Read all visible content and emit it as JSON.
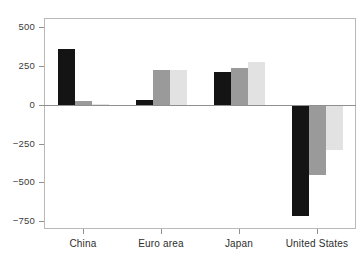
{
  "chart_data": {
    "type": "bar",
    "title": "",
    "subtitle": "",
    "xlabel": "",
    "ylabel": "",
    "categories": [
      "China",
      "Euro area",
      "Japan",
      "United States"
    ],
    "series": [
      {
        "name": "series-1",
        "color": "#141414",
        "values": [
          357,
          30,
          215,
          -714
        ]
      },
      {
        "name": "series-2",
        "color": "#9a9a9a",
        "values": [
          25,
          225,
          240,
          -450
        ]
      },
      {
        "name": "series-3",
        "color": "#e2e2e2",
        "values": [
          6,
          225,
          275,
          -290
        ]
      }
    ],
    "ylim": [
      -800,
      560
    ],
    "yticks": [
      500,
      250,
      0,
      -250,
      -500,
      -750
    ],
    "ytick_labels": [
      "500",
      "250",
      "0",
      "−250",
      "−500",
      "−750"
    ],
    "grid": false,
    "legend": "none",
    "zero_line": true,
    "frame": true,
    "orientation": "vertical"
  }
}
